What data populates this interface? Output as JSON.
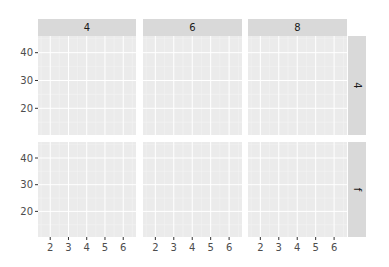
{
  "chart_data": {
    "type": "scatter",
    "title": "",
    "xlabel": "",
    "ylabel": "",
    "facet": {
      "layout": "grid",
      "cols": [
        "4",
        "6",
        "8"
      ],
      "rows": [
        "4",
        "f"
      ],
      "col_strip_position": "top",
      "row_strip_position": "right"
    },
    "xlim": [
      1.33,
      6.7
    ],
    "ylim": [
      10.4,
      46.0
    ],
    "x_ticks": [
      2,
      3,
      4,
      5,
      6
    ],
    "x_tick_labels": [
      "2",
      "3",
      "4",
      "5",
      "6"
    ],
    "y_ticks": [
      20,
      30,
      40
    ],
    "y_tick_labels": [
      "20",
      "30",
      "40"
    ],
    "grid": true,
    "minor_grid": true,
    "legend": "none",
    "series": [],
    "panels": [
      {
        "row": "4",
        "col": "4",
        "points": []
      },
      {
        "row": "4",
        "col": "6",
        "points": []
      },
      {
        "row": "4",
        "col": "8",
        "points": []
      },
      {
        "row": "f",
        "col": "4",
        "points": []
      },
      {
        "row": "f",
        "col": "6",
        "points": []
      },
      {
        "row": "f",
        "col": "8",
        "points": []
      }
    ],
    "colors": {
      "panel_background": "#ebebeb",
      "strip_background": "#d9d9d9",
      "grid_major": "#ffffff",
      "grid_minor": "#f5f5f5",
      "tick_text": "#4d4d4d",
      "strip_text": "#1a1a1a"
    }
  }
}
